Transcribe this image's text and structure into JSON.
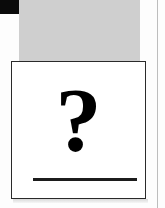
{
  "card": {
    "symbol": "?",
    "symbol_icon": "question-mark-icon"
  },
  "colors": {
    "corner_block": "#0a0a0a",
    "gray_panel": "#cfcfcf",
    "card_border": "#2a2a2a",
    "card_background": "#ffffff",
    "symbol": "#000000",
    "answer_line": "#1c1c1c",
    "divider_line": "#bdbdbd"
  }
}
